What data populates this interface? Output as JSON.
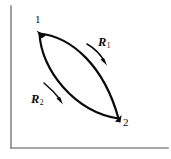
{
  "figure": {
    "type": "thermodynamic-path-diagram",
    "background_color": "#ffffff",
    "curve_color": "#0b0b0b",
    "axis_color": "#8a8a8a",
    "axes": {
      "y_axis_label": "",
      "x_axis_label": "",
      "origin": [
        11,
        148
      ],
      "y_axis_top": [
        11,
        6
      ],
      "x_axis_right": [
        168,
        148
      ]
    },
    "points": [
      {
        "id": "point-1",
        "label": "1",
        "x": 39,
        "y": 33
      },
      {
        "id": "point-2",
        "label": "2",
        "x": 118,
        "y": 119
      }
    ],
    "paths": [
      {
        "id": "path-r1",
        "label": "R",
        "subscript": "1",
        "position": "upper",
        "direction": "1-to-2",
        "arrow_from": [
          88,
          45
        ],
        "arrow_to": [
          106,
          64
        ]
      },
      {
        "id": "path-r2",
        "label": "R",
        "subscript": "2",
        "position": "lower",
        "direction": "1-to-2",
        "arrow_from": [
          44,
          84
        ],
        "arrow_to": [
          62,
          103
        ]
      }
    ]
  }
}
